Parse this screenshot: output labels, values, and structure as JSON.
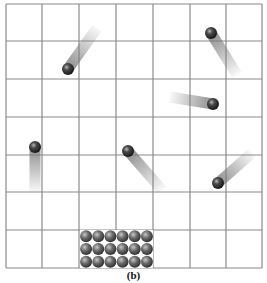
{
  "figure": {
    "caption": "(b)",
    "grid": {
      "columns": 7,
      "rows": 7,
      "x_lines": [
        6,
        42,
        79,
        116,
        153,
        190,
        226,
        262
      ],
      "y_lines": [
        4,
        41,
        79,
        117,
        155,
        192,
        230,
        268
      ],
      "line_color": "#8a8a8a"
    },
    "moving_particles": [
      {
        "id": "p1",
        "x": 68,
        "y": 69,
        "trail_end_x": 97,
        "trail_end_y": 28
      },
      {
        "id": "p2",
        "x": 211,
        "y": 33,
        "trail_end_x": 237,
        "trail_end_y": 75
      },
      {
        "id": "p3",
        "x": 213,
        "y": 104,
        "trail_end_x": 170,
        "trail_end_y": 97
      },
      {
        "id": "p4",
        "x": 35,
        "y": 147,
        "trail_end_x": 35,
        "trail_end_y": 192
      },
      {
        "id": "p5",
        "x": 128,
        "y": 151,
        "trail_end_x": 162,
        "trail_end_y": 190
      },
      {
        "id": "p6",
        "x": 218,
        "y": 183,
        "trail_end_x": 252,
        "trail_end_y": 153
      }
    ],
    "packed_cluster": {
      "columns": 6,
      "rows": 3,
      "x": 80,
      "y": 230,
      "width": 73,
      "height": 38
    },
    "particle_radius": 6,
    "colors": {
      "particle_dark": "#1a1a1a",
      "particle_light": "#9a9a9a",
      "cluster_dark": "#2e2e2e",
      "cluster_light": "#a8a8a8",
      "trail": "#7a7a7a"
    }
  }
}
